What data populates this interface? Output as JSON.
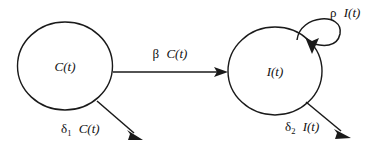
{
  "diagram": {
    "type": "compartmental-flow-diagram",
    "background_color": "#ffffff",
    "stroke_color": "#1a1a1a",
    "text_color": "#111111",
    "nodes": [
      {
        "id": "C",
        "label": "C(t)",
        "shape": "circle",
        "cx": 65,
        "cy": 66,
        "rx": 47,
        "ry": 44
      },
      {
        "id": "I",
        "label": "I(t)",
        "shape": "circle",
        "cx": 275,
        "cy": 71,
        "rx": 47,
        "ry": 44
      }
    ],
    "edges": [
      {
        "id": "C-to-I",
        "from": "C",
        "to": "I",
        "kind": "straight",
        "rate_symbol": "β",
        "rate_variable": "C(t)",
        "label": "β C(t)"
      },
      {
        "id": "C-out",
        "from": "C",
        "to": "outside",
        "kind": "straight",
        "rate_symbol": "δ",
        "rate_subscript": "1",
        "rate_variable": "C(t)",
        "label": "δ₁ C(t)"
      },
      {
        "id": "I-self",
        "from": "I",
        "to": "I",
        "kind": "self-loop",
        "rate_symbol": "ρ",
        "rate_variable": "I(t)",
        "label": "ρ I(t)"
      },
      {
        "id": "I-out",
        "from": "I",
        "to": "outside",
        "kind": "straight",
        "rate_symbol": "δ",
        "rate_subscript": "2",
        "rate_variable": "I(t)",
        "label": "δ₂ I(t)"
      }
    ]
  }
}
